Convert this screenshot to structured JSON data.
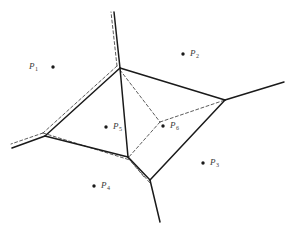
{
  "figure": {
    "type": "voronoi-delaunay-diagram",
    "width": 288,
    "height": 229,
    "background_color": "#ffffff",
    "solid_line_color": "#1a1a1a",
    "dashed_line_color": "#4a4a4a",
    "site_dot_color": "#1a1a1a",
    "label_color": "#3a3a3a"
  },
  "sites": [
    {
      "id": "p1",
      "label": "P",
      "subscript": "1",
      "dot_x": 53,
      "dot_y": 67,
      "label_x": 29,
      "label_y": 62,
      "label_side": "left"
    },
    {
      "id": "p2",
      "label": "P",
      "subscript": "2",
      "dot_x": 183,
      "dot_y": 54,
      "label_x": 190,
      "label_y": 49,
      "label_side": "right"
    },
    {
      "id": "p3",
      "label": "P",
      "subscript": "3",
      "dot_x": 203,
      "dot_y": 163,
      "label_x": 210,
      "label_y": 158,
      "label_side": "right"
    },
    {
      "id": "p4",
      "label": "P",
      "subscript": "4",
      "dot_x": 94,
      "dot_y": 186,
      "label_x": 101,
      "label_y": 181,
      "label_side": "right"
    },
    {
      "id": "p5",
      "label": "P",
      "subscript": "5",
      "dot_x": 106,
      "dot_y": 127,
      "label_x": 113,
      "label_y": 122,
      "label_side": "right"
    },
    {
      "id": "p6",
      "label": "P",
      "subscript": "6",
      "dot_x": 163,
      "dot_y": 126,
      "label_x": 170,
      "label_y": 121,
      "label_side": "right"
    }
  ],
  "voronoi_vertices": [
    {
      "id": "v-top",
      "x": 120,
      "y": 68
    },
    {
      "id": "v-left",
      "x": 45,
      "y": 136
    },
    {
      "id": "v-right",
      "x": 225,
      "y": 100
    },
    {
      "id": "v-bottom",
      "x": 150,
      "y": 180
    },
    {
      "id": "v-lower-left",
      "x": 128,
      "y": 157
    }
  ],
  "voronoi_edges": [
    {
      "id": "e-top-left",
      "from": [
        120,
        68
      ],
      "to": [
        45,
        136
      ]
    },
    {
      "id": "e-top-right",
      "from": [
        120,
        68
      ],
      "to": [
        225,
        100
      ]
    },
    {
      "id": "e-top-down",
      "from": [
        120,
        68
      ],
      "to": [
        128,
        157
      ]
    },
    {
      "id": "e-left-bottom",
      "from": [
        45,
        136
      ],
      "to": [
        128,
        157
      ]
    },
    {
      "id": "e-lowerleft-bot",
      "from": [
        128,
        157
      ],
      "to": [
        150,
        180
      ]
    },
    {
      "id": "e-right-bottom",
      "from": [
        225,
        100
      ],
      "to": [
        150,
        180
      ]
    }
  ],
  "voronoi_rays": [
    {
      "id": "ray-up",
      "from": [
        120,
        68
      ],
      "to": [
        114,
        12
      ]
    },
    {
      "id": "ray-left",
      "from": [
        45,
        136
      ],
      "to": [
        12,
        148
      ]
    },
    {
      "id": "ray-upper-right",
      "from": [
        225,
        100
      ],
      "to": [
        284,
        82
      ]
    },
    {
      "id": "ray-down",
      "from": [
        150,
        180
      ],
      "to": [
        160,
        222
      ]
    }
  ],
  "delaunay_edges": [
    {
      "id": "d-top-ray",
      "from": [
        117,
        66
      ],
      "to": [
        111,
        12
      ]
    },
    {
      "id": "d-top-left",
      "from": [
        117,
        66
      ],
      "to": [
        43,
        133
      ]
    },
    {
      "id": "d-left-ray",
      "from": [
        43,
        133
      ],
      "to": [
        11,
        144
      ]
    },
    {
      "id": "d-left-lowerleft",
      "from": [
        43,
        133
      ],
      "to": [
        130,
        160
      ]
    },
    {
      "id": "d-lowerleft-bot",
      "from": [
        130,
        160
      ],
      "to": [
        150,
        183
      ]
    },
    {
      "id": "d-top-center",
      "from": [
        120,
        70
      ],
      "to": [
        160,
        122
      ]
    },
    {
      "id": "d-center-right",
      "from": [
        160,
        122
      ],
      "to": [
        225,
        100
      ]
    },
    {
      "id": "d-center-lowleft",
      "from": [
        160,
        122
      ],
      "to": [
        128,
        158
      ]
    },
    {
      "id": "d-lowleft-down",
      "from": [
        128,
        158
      ],
      "to": [
        145,
        178
      ]
    }
  ]
}
